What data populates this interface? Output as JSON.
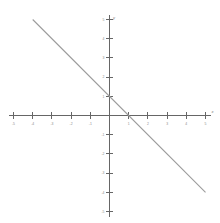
{
  "figure": {
    "background_color": "#ffffff",
    "axis_color": "#666666",
    "line_color": "#9b9b9b",
    "tick_label_color": "#8a8a8a"
  },
  "axis_names": {
    "x": "x",
    "y": "y"
  },
  "chart_data": {
    "type": "line",
    "title": "",
    "subtitle": "",
    "xlabel": "x",
    "ylabel": "y",
    "xlim": [
      -5,
      5
    ],
    "ylim": [
      -5,
      5
    ],
    "grid": false,
    "legend": false,
    "equation": "y = -x + 1",
    "slope": -1,
    "y_intercept": 1,
    "x_intercept": 1,
    "x_ticks": [
      -5,
      -4,
      -3,
      -2,
      -1,
      1,
      2,
      3,
      4,
      5
    ],
    "y_ticks": [
      5,
      4,
      3,
      2,
      1,
      -1,
      -2,
      -3,
      -4,
      -5
    ],
    "x_tick_labels": [
      "-5",
      "-4",
      "-3",
      "-2",
      "-1",
      "1",
      "2",
      "3",
      "4",
      "5"
    ],
    "y_tick_labels": [
      "5",
      "4",
      "3",
      "2",
      "1",
      "-1",
      "-2",
      "-3",
      "-4",
      "-5"
    ],
    "series": [
      {
        "name": "y = -x + 1",
        "color": "#9b9b9b",
        "x": [
          -4,
          5
        ],
        "y": [
          5,
          -4
        ],
        "points": [
          {
            "x": -4,
            "y": 5
          },
          {
            "x": -3,
            "y": 4
          },
          {
            "x": -2,
            "y": 3
          },
          {
            "x": -1,
            "y": 2
          },
          {
            "x": 0,
            "y": 1
          },
          {
            "x": 1,
            "y": 0
          },
          {
            "x": 2,
            "y": -1
          },
          {
            "x": 3,
            "y": -2
          },
          {
            "x": 4,
            "y": -3
          },
          {
            "x": 5,
            "y": -4
          }
        ]
      }
    ]
  }
}
